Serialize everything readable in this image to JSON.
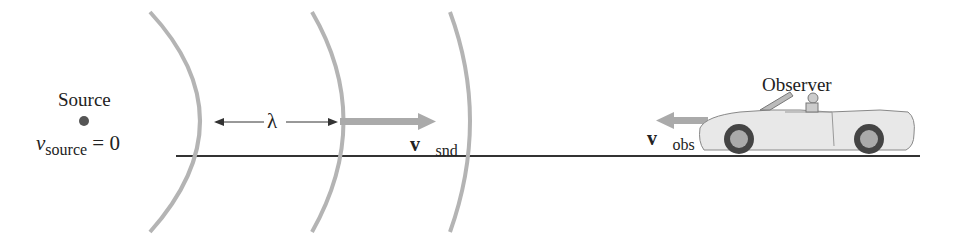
{
  "figure": {
    "source": {
      "title": "Source",
      "velocity_symbol": "v",
      "velocity_subscript": "source",
      "velocity_value": "= 0"
    },
    "wavelength_label": "λ",
    "sound_velocity": {
      "symbol": "v⃗",
      "subscript": "snd"
    },
    "observer": {
      "title": "Observer",
      "velocity_symbol": "v⃗",
      "velocity_subscript": "obs"
    }
  },
  "colors": {
    "wavefront": "#b4b4b4",
    "arrow": "#aaaaaa",
    "ground": "#333333",
    "text": "#222222",
    "car_body": "#e8e8e8"
  }
}
